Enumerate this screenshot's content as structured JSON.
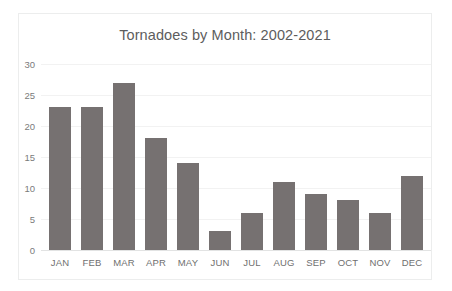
{
  "chart_data": {
    "type": "bar",
    "title": "Tornadoes by Month: 2002-2021",
    "xlabel": "",
    "ylabel": "",
    "categories": [
      "JAN",
      "FEB",
      "MAR",
      "APR",
      "MAY",
      "JUN",
      "JUL",
      "AUG",
      "SEP",
      "OCT",
      "NOV",
      "DEC"
    ],
    "values": [
      23,
      23,
      27,
      18,
      14,
      3,
      6,
      11,
      9,
      8,
      6,
      12
    ],
    "ylim": [
      0,
      30
    ],
    "yticks": [
      0,
      5,
      10,
      15,
      20,
      25,
      30
    ],
    "ytick_labels": [
      "0",
      "5",
      "10",
      "15",
      "20",
      "25",
      "30"
    ],
    "grid": true,
    "legend": false,
    "bar_color": "#767171",
    "gridline_color": "#f2f2f2",
    "title_color": "#5d5d5d",
    "tick_label_color": "#7b7b7b",
    "plot_background": "#ffffff",
    "frame_border_color": "#eceded"
  }
}
